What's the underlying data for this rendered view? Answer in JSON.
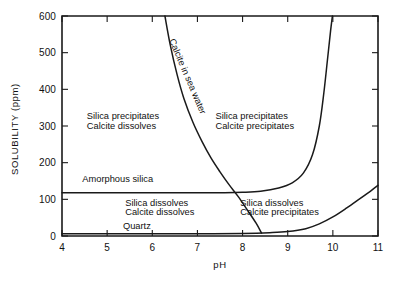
{
  "chart_data": {
    "type": "line",
    "title": "",
    "xlabel": "pH",
    "ylabel": "SOLUBILITY (ppm)",
    "xlim": [
      4,
      11
    ],
    "ylim": [
      0,
      600
    ],
    "grid": false,
    "legend_position": "none",
    "xticks": [
      "4",
      "5",
      "6",
      "7",
      "8",
      "9",
      "10",
      "11"
    ],
    "xtick_values": [
      4,
      5,
      6,
      7,
      8,
      9,
      10,
      11
    ],
    "yticks": [
      "0",
      "100",
      "200",
      "300",
      "400",
      "500",
      "600"
    ],
    "ytick_values": [
      0,
      100,
      200,
      300,
      400,
      500,
      600
    ],
    "series": [
      {
        "name": "Calcite in sea water",
        "points": [
          [
            6.28,
            600
          ],
          [
            6.4,
            520
          ],
          [
            6.55,
            440
          ],
          [
            6.7,
            375
          ],
          [
            6.9,
            310
          ],
          [
            7.1,
            258
          ],
          [
            7.3,
            213
          ],
          [
            7.5,
            175
          ],
          [
            7.7,
            140
          ],
          [
            7.9,
            108
          ],
          [
            8.1,
            72
          ],
          [
            8.3,
            35
          ],
          [
            8.42,
            8
          ]
        ]
      },
      {
        "name": "Amorphous silica",
        "points": [
          [
            4.0,
            118
          ],
          [
            5.0,
            118
          ],
          [
            6.0,
            118
          ],
          [
            7.0,
            118
          ],
          [
            7.6,
            118
          ],
          [
            8.0,
            119
          ],
          [
            8.4,
            122
          ],
          [
            8.8,
            131
          ],
          [
            9.1,
            145
          ],
          [
            9.35,
            172
          ],
          [
            9.55,
            222
          ],
          [
            9.7,
            300
          ],
          [
            9.8,
            390
          ],
          [
            9.88,
            480
          ],
          [
            9.95,
            560
          ],
          [
            9.99,
            600
          ]
        ]
      },
      {
        "name": "Quartz",
        "points": [
          [
            4.0,
            6
          ],
          [
            5.0,
            6
          ],
          [
            6.0,
            6
          ],
          [
            7.0,
            6
          ],
          [
            8.0,
            7
          ],
          [
            8.6,
            9
          ],
          [
            9.0,
            12
          ],
          [
            9.4,
            20
          ],
          [
            9.7,
            33
          ],
          [
            10.0,
            52
          ],
          [
            10.3,
            76
          ],
          [
            10.6,
            102
          ],
          [
            10.85,
            124
          ],
          [
            11.0,
            138
          ]
        ]
      }
    ],
    "curve_labels": [
      {
        "text": "Calcite in sea water",
        "x": 6.72,
        "y": 432,
        "rotation": 67
      }
    ],
    "annotations": [
      {
        "text": "Silica precipitates",
        "x": 4.55,
        "y": 318
      },
      {
        "text": "Calcite dissolves",
        "x": 4.55,
        "y": 292
      },
      {
        "text": "Silica precipitates",
        "x": 7.4,
        "y": 318
      },
      {
        "text": "Calcite precipitates",
        "x": 7.4,
        "y": 292
      },
      {
        "text": "Amorphous silica",
        "x": 4.45,
        "y": 148
      },
      {
        "text": "Silica dissolves",
        "x": 5.4,
        "y": 82
      },
      {
        "text": "Calcite dissolves",
        "x": 5.4,
        "y": 57
      },
      {
        "text": "Silica dissolves",
        "x": 7.95,
        "y": 82
      },
      {
        "text": "Calcite precipitates",
        "x": 7.95,
        "y": 57
      },
      {
        "text": "Quartz",
        "x": 5.35,
        "y": 18
      }
    ]
  },
  "colors": {
    "ink": "#1a1a1a",
    "background": "#ffffff"
  }
}
